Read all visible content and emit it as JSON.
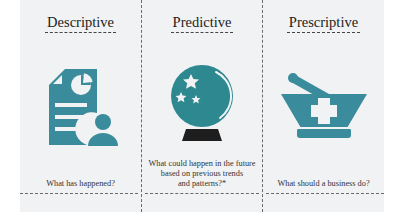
{
  "colors": {
    "teal": "#3a8b9b",
    "crystal_teal": "#2e8890",
    "stand": "#1e1e1e",
    "panel_bg": "#f1f2f4",
    "divider": "#6a6a6a"
  },
  "columns": [
    {
      "title": "Descriptive",
      "icon": "report-chart-user-icon",
      "caption": "What has happened?"
    },
    {
      "title": "Predictive",
      "icon": "crystal-ball-icon",
      "caption_lines": [
        "What could happen in the future",
        "based on previous trends",
        "and patterns?*"
      ]
    },
    {
      "title": "Prescriptive",
      "icon": "mortar-pestle-medical-cross-icon",
      "caption": "What should a business do?"
    }
  ]
}
